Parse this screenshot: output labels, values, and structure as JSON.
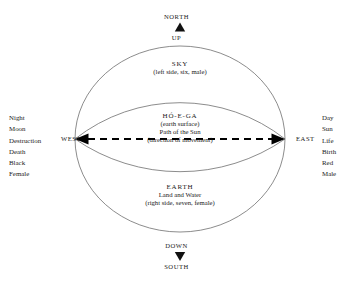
{
  "figure": {
    "directions": {
      "north": "NORTH",
      "south": "SOUTH",
      "east": "EAST",
      "west": "WEST",
      "up": "UP",
      "down": "DOWN"
    },
    "zones": {
      "sky": {
        "title": "SKY",
        "attributes": "(left side, six, male)"
      },
      "band": {
        "title": "HÓ-E-GA",
        "gloss": "(earth surface)",
        "path": "Path of the Sun",
        "movement": "(direction of movement)"
      },
      "earth": {
        "title": "EARTH",
        "subtitle": "Land and Water",
        "attributes": "(right side, seven, female)"
      }
    },
    "west_associations": [
      "Night",
      "Moon",
      "Destruction",
      "Death",
      "Black",
      "Female"
    ],
    "east_associations": [
      "Day",
      "Sun",
      "Life",
      "Birth",
      "Red",
      "Male"
    ],
    "colors": {
      "stroke": "#6e6e6e",
      "text": "#1a1a1a",
      "arrow": "#000000",
      "background": "#ffffff"
    }
  }
}
